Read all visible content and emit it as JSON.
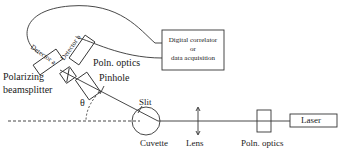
{
  "diagram": {
    "type": "dynamic light scattering setup schematic",
    "components": {
      "detector_a": "Detector a",
      "detector_b": "Detector b",
      "correlator_line1": "Digital correlator",
      "correlator_line2": "or",
      "correlator_line3": "data acquisition",
      "poln_optics_top": "Poln. optics",
      "polarizing_line1": "Polarizing",
      "polarizing_line2": "beamsplitter",
      "pinhole": "Pinhole",
      "theta": "θ",
      "slit": "Slit",
      "cuvette": "Cuvette",
      "lens": "Lens",
      "poln_optics_bottom": "Poln. optics",
      "laser": "Laser"
    },
    "colors": {
      "line": "#333333",
      "background": "#ffffff"
    }
  }
}
